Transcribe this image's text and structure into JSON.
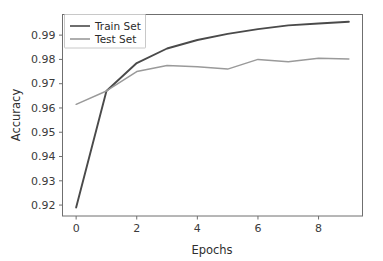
{
  "chart_data": {
    "type": "line",
    "title": "",
    "xlabel": "Epochs",
    "ylabel": "Accuracy",
    "xlim": [
      -0.45,
      9.45
    ],
    "ylim": [
      0.9155,
      0.9985
    ],
    "xticks": [
      0,
      2,
      4,
      6,
      8
    ],
    "xtick_labels": [
      "0",
      "2",
      "4",
      "6",
      "8"
    ],
    "yticks": [
      0.92,
      0.93,
      0.94,
      0.95,
      0.96,
      0.97,
      0.98,
      0.99
    ],
    "ytick_labels": [
      "0.92",
      "0.93",
      "0.94",
      "0.95",
      "0.96",
      "0.97",
      "0.98",
      "0.99"
    ],
    "grid": false,
    "legend_position": "upper left",
    "x": [
      0,
      1,
      2,
      3,
      4,
      5,
      6,
      7,
      8,
      9
    ],
    "series": [
      {
        "name": "Train Set",
        "color": "#4a4a4a",
        "width": 1.9,
        "values": [
          0.919,
          0.967,
          0.9785,
          0.9845,
          0.988,
          0.9905,
          0.9925,
          0.994,
          0.9948,
          0.9955
        ]
      },
      {
        "name": "Test Set",
        "color": "#9a9a9a",
        "width": 1.5,
        "values": [
          0.9615,
          0.967,
          0.975,
          0.9775,
          0.977,
          0.976,
          0.98,
          0.979,
          0.9805,
          0.9802
        ]
      }
    ]
  },
  "axes": {
    "xlabel": "Epochs",
    "ylabel": "Accuracy"
  },
  "legend": {
    "entries": [
      {
        "label": "Train Set"
      },
      {
        "label": "Test Set"
      }
    ]
  },
  "colors": {
    "train": "#4a4a4a",
    "test": "#9a9a9a",
    "spine": "#6f6f6f",
    "text": "#2e2e2e",
    "background": "#ffffff"
  }
}
